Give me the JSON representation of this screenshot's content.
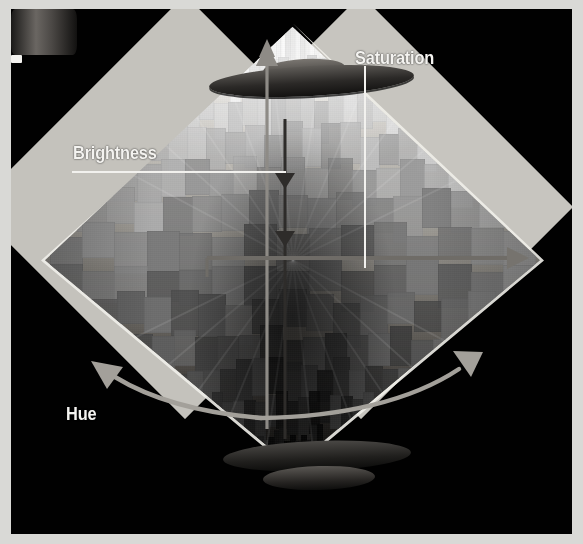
{
  "figure": {
    "background_color": "#010101",
    "border_color": "#d9d9d6",
    "label_color": "#f4f3f0",
    "arrow_color": "#8e8b86"
  },
  "labels": {
    "saturation": "Saturation",
    "brightness": "Brightness",
    "hue": "Hue"
  },
  "axes": [
    {
      "name": "brightness",
      "label": "Brightness",
      "orientation": "vertical",
      "direction": "up",
      "meaning": "value from black at bottom apex to white at top"
    },
    {
      "name": "saturation",
      "label": "Saturation",
      "orientation": "horizontal",
      "direction": "right",
      "meaning": "radial distance from neutral grey axis outward to pure colour"
    },
    {
      "name": "hue",
      "label": "Hue",
      "orientation": "circular",
      "direction": "around",
      "meaning": "angle around the central vertical axis"
    }
  ],
  "solid": {
    "shape": "bipyramid",
    "facets": "stacked colour chips",
    "rendering": "grayscale photograph",
    "top_apex": "white",
    "bottom_apex": "black"
  },
  "hardware": {
    "top_ring": "dark rotating disc",
    "base": "pedestal with two discs and a cylinder",
    "indicator": "small white marker"
  }
}
